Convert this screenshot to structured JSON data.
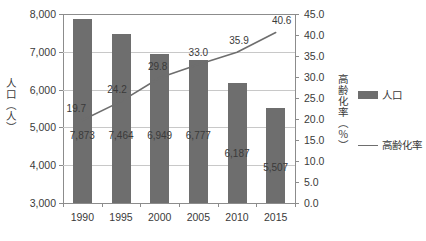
{
  "chart_data": {
    "type": "bar",
    "title": "",
    "subtitle": "",
    "xlabel": "",
    "categories": [
      "1990",
      "1995",
      "2000",
      "2005",
      "2010",
      "2015"
    ],
    "grid": true,
    "legend_position": "right",
    "series": [
      {
        "name": "人口",
        "type": "bar",
        "axis": "left",
        "color": "#6e6e6e",
        "values": [
          7873,
          7464,
          6949,
          6777,
          6187,
          5507
        ],
        "labels": [
          "7,873",
          "7,464",
          "6,949",
          "6,777",
          "6,187",
          "5,507"
        ]
      },
      {
        "name": "高齢化率",
        "type": "line",
        "axis": "right",
        "color": "#6e6e6e",
        "values": [
          19.7,
          24.2,
          29.8,
          33.0,
          35.9,
          40.6
        ],
        "labels": [
          "19.7",
          "24.2",
          "29.8",
          "33.0",
          "35.9",
          "40.6"
        ]
      }
    ],
    "left_axis": {
      "title": "人口（人）",
      "ylim": [
        3000,
        8000
      ],
      "tick_step": 1000,
      "ticks": [
        "3,000",
        "4,000",
        "5,000",
        "6,000",
        "7,000",
        "8,000"
      ]
    },
    "right_axis": {
      "title": "高齢化率（％）",
      "ylim": [
        0,
        45
      ],
      "tick_step": 5,
      "ticks": [
        "0.0",
        "5.0",
        "10.0",
        "15.0",
        "20.0",
        "25.0",
        "30.0",
        "35.0",
        "40.0",
        "45.0"
      ]
    }
  },
  "legend": {
    "items": [
      {
        "label": "人口",
        "marker": "bar-swatch",
        "color": "#6e6e6e"
      },
      {
        "label": "高齢化率",
        "marker": "line-swatch",
        "color": "#6e6e6e"
      }
    ]
  },
  "axis_titles": {
    "left": "人口（人）",
    "right": "高齢化率（％）"
  }
}
